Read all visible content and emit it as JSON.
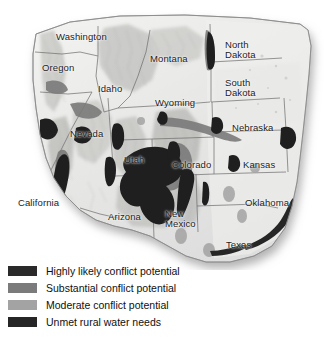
{
  "figure": {
    "kind": "relief-map",
    "region": "Western United States",
    "background_color": "#ffffff"
  },
  "map": {
    "base_fill": "#e9e9e7",
    "relief_light": "#f4f4f2",
    "relief_shade": "#b9b9b6",
    "border_color": "#6e6e6e",
    "outline_color": "#8a8a8a",
    "shadow_color": "#bdbdbd",
    "state_labels": [
      {
        "name": "Washington",
        "text": "Washington",
        "x": 56,
        "y": 32
      },
      {
        "name": "Oregon",
        "text": "Oregon",
        "x": 42,
        "y": 63
      },
      {
        "name": "Idaho",
        "text": "Idaho",
        "x": 98,
        "y": 84
      },
      {
        "name": "Montana",
        "text": "Montana",
        "x": 150,
        "y": 54
      },
      {
        "name": "North Dakota",
        "text": "North\nDakota",
        "x": 225,
        "y": 40
      },
      {
        "name": "South Dakota",
        "text": "South\nDakota",
        "x": 225,
        "y": 78
      },
      {
        "name": "Wyoming",
        "text": "Wyoming",
        "x": 155,
        "y": 98
      },
      {
        "name": "Nebraska",
        "text": "Nebraska",
        "x": 232,
        "y": 123
      },
      {
        "name": "Nevada",
        "text": "Nevada",
        "x": 70,
        "y": 129
      },
      {
        "name": "Utah",
        "text": "Utah",
        "x": 124,
        "y": 155
      },
      {
        "name": "Colorado",
        "text": "Colorado",
        "x": 172,
        "y": 160
      },
      {
        "name": "Kansas",
        "text": "Kansas",
        "x": 243,
        "y": 160
      },
      {
        "name": "California",
        "text": "California",
        "x": 18,
        "y": 198
      },
      {
        "name": "Arizona",
        "text": "Arizona",
        "x": 108,
        "y": 212
      },
      {
        "name": "New Mexico",
        "text": "New\nMexico",
        "x": 165,
        "y": 209
      },
      {
        "name": "Oklahoma",
        "text": "Oklahoma",
        "x": 245,
        "y": 198
      },
      {
        "name": "Texas",
        "text": "Texas",
        "x": 226,
        "y": 240
      }
    ]
  },
  "legend": {
    "items": [
      {
        "label": "Highly likely conflict potential",
        "color": "#2a2a2a",
        "swatch_name": "highly-likely"
      },
      {
        "label": "Substantial conflict potential",
        "color": "#7b7b7b",
        "swatch_name": "substantial"
      },
      {
        "label": "Moderate conflict potential",
        "color": "#a3a3a3",
        "swatch_name": "moderate"
      },
      {
        "label": "Unmet rural water needs",
        "color": "#262626",
        "swatch_name": "unmet-rural"
      }
    ]
  }
}
